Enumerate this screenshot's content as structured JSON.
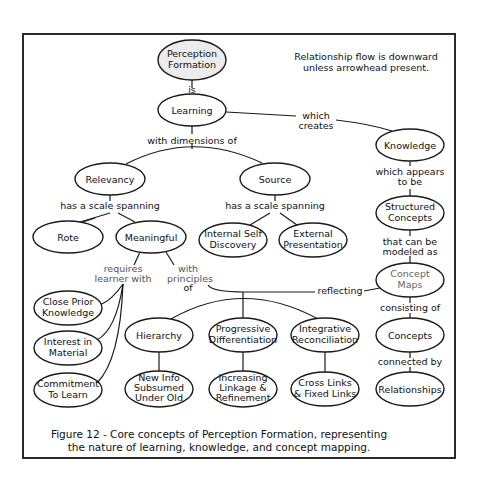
{
  "note": {
    "line1": "Relationship flow is downward",
    "line2": "unless arrowhead present."
  },
  "nodes": {
    "perception_formation": {
      "l1": "Perception",
      "l2": "Formation"
    },
    "learning": {
      "l1": "Learning"
    },
    "knowledge": {
      "l1": "Knowledge"
    },
    "relevancy": {
      "l1": "Relevancy"
    },
    "source": {
      "l1": "Source"
    },
    "rote": {
      "l1": "Rote"
    },
    "meaningful": {
      "l1": "Meaningful"
    },
    "internal_self_discovery": {
      "l1": "Internal Self",
      "l2": "Discovery"
    },
    "external_presentation": {
      "l1": "External",
      "l2": "Presentation"
    },
    "structured_concepts": {
      "l1": "Structured",
      "l2": "Concepts"
    },
    "concept_maps": {
      "l1": "Concept",
      "l2": "Maps"
    },
    "close_prior_knowledge": {
      "l1": "Close Prior",
      "l2": "Knowledge"
    },
    "interest_in_material": {
      "l1": "Interest in",
      "l2": "Material"
    },
    "commitment_to_learn": {
      "l1": "Commitment",
      "l2": "To Learn"
    },
    "hierarchy": {
      "l1": "Hierarchy"
    },
    "progressive_differentiation": {
      "l1": "Progressive",
      "l2": "Differentiation"
    },
    "integrative_reconciliation": {
      "l1": "Integrative",
      "l2": "Reconciliation"
    },
    "concepts": {
      "l1": "Concepts"
    },
    "new_info": {
      "l1": "New Info",
      "l2": "Subsumed",
      "l3": "Under Old"
    },
    "increasing_linkage": {
      "l1": "Increasing",
      "l2": "Linkage &",
      "l3": "Refinement"
    },
    "cross_links": {
      "l1": "Cross Links",
      "l2": "& Fixed Links"
    },
    "relationships": {
      "l1": "Relationships"
    }
  },
  "links": {
    "is": "is",
    "which_creates": {
      "l1": "which",
      "l2": "creates"
    },
    "with_dimensions_of": "with dimensions of",
    "has_scale_relevancy": "has a scale spanning",
    "has_scale_source": "has a scale spanning",
    "which_appears": {
      "l1": "which appears",
      "l2": "to be"
    },
    "that_can_be": {
      "l1": "that can be",
      "l2": "modeled as"
    },
    "requires": {
      "l1": "requires",
      "l2": "learner with"
    },
    "with_principles": {
      "l1": "with",
      "l2": "principles",
      "l3": "of"
    },
    "reflecting": "reflecting",
    "consisting_of": "consisting of",
    "connected_by": "connected by"
  },
  "caption": {
    "line1": "Figure 12 - Core concepts of Perception Formation, representing",
    "line2": "the nature of learning, knowledge, and concept mapping."
  }
}
